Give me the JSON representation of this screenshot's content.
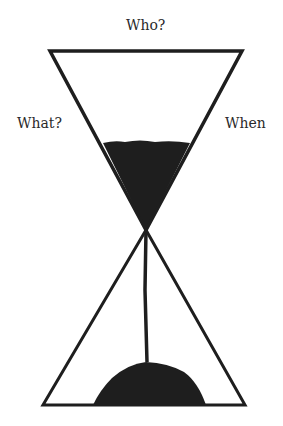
{
  "diagram": {
    "type": "hourglass",
    "labels": {
      "top": "Who?",
      "left": "What?",
      "right": "When"
    },
    "colors": {
      "stroke": "#1e1e1e",
      "sand": "#1e1e1e",
      "text": "#2a2a2a",
      "background": "#ffffff"
    }
  }
}
